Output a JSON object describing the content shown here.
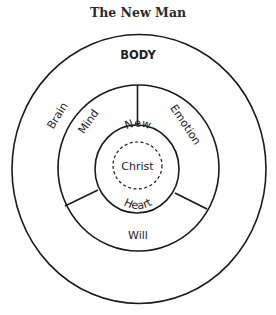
{
  "title": "The New Man",
  "layers": {
    "outer": {
      "label": "BODY"
    },
    "body_segment": {
      "label": "Brain"
    },
    "soul": {
      "segments": [
        {
          "label": "Mind"
        },
        {
          "label": "Emotion"
        },
        {
          "label": "Will"
        }
      ]
    },
    "spirit": {
      "label_top": "New",
      "label_bottom": "Heart"
    },
    "core": {
      "label": "Christ"
    }
  },
  "colors": {
    "stroke": "#1a1a1a",
    "text": "#222222",
    "background": "#ffffff"
  }
}
